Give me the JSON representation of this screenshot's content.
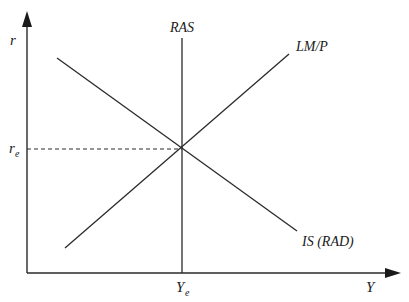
{
  "diagram": {
    "type": "economics IS-LM with RAS",
    "axes": {
      "y_label": "r",
      "x_label": "Y"
    },
    "curves": [
      {
        "name": "RAS",
        "label": "RAS",
        "kind": "vertical"
      },
      {
        "name": "LM/P",
        "label": "LM/P",
        "kind": "upward-sloping"
      },
      {
        "name": "IS (RAD)",
        "label": "IS (RAD)",
        "kind": "downward-sloping"
      }
    ],
    "equilibrium": {
      "r_label": "r",
      "r_sub": "e",
      "y_label": "Y",
      "y_sub": "e"
    },
    "colors": {
      "line": "#2a2a2a",
      "background": "#ffffff"
    }
  }
}
